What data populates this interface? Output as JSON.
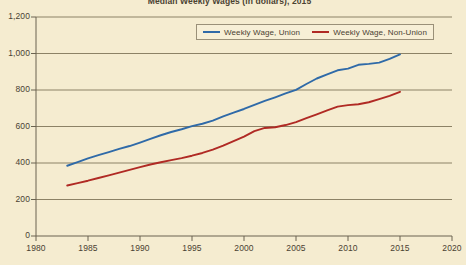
{
  "chart_data": {
    "type": "line",
    "title": "Median Weekly Wages (in dollars), 2015",
    "xlabel": "",
    "ylabel": "",
    "xlim": [
      1980,
      2020
    ],
    "ylim": [
      0,
      1200
    ],
    "grid": true,
    "legend_position": "top-right",
    "x_ticks": [
      "1980",
      "1985",
      "1990",
      "1995",
      "2000",
      "2005",
      "2010",
      "2015",
      "2020"
    ],
    "y_ticks": [
      "0",
      "200",
      "400",
      "600",
      "800",
      "1,000",
      "1,200"
    ],
    "series": [
      {
        "name": "Weekly Wage, Union",
        "color": "#2f6aa8",
        "x": [
          1983,
          1984,
          1985,
          1986,
          1987,
          1988,
          1989,
          1990,
          1991,
          1992,
          1993,
          1994,
          1995,
          1996,
          1997,
          1998,
          1999,
          2000,
          2001,
          2002,
          2003,
          2004,
          2005,
          2006,
          2007,
          2008,
          2009,
          2010,
          2011,
          2012,
          2013,
          2014,
          2015
        ],
        "values": [
          385,
          405,
          425,
          443,
          460,
          477,
          493,
          512,
          532,
          552,
          570,
          585,
          602,
          615,
          632,
          655,
          676,
          696,
          718,
          740,
          760,
          781,
          801,
          833,
          863,
          886,
          908,
          917,
          938,
          943,
          950,
          970,
          995
        ]
      },
      {
        "name": "Weekly Wage, Non-Union",
        "color": "#b02a24",
        "x": [
          1983,
          1984,
          1985,
          1986,
          1987,
          1988,
          1989,
          1990,
          1991,
          1992,
          1993,
          1994,
          1995,
          1996,
          1997,
          1998,
          1999,
          2000,
          2001,
          2002,
          2003,
          2004,
          2005,
          2006,
          2007,
          2008,
          2009,
          2010,
          2011,
          2012,
          2013,
          2014,
          2015
        ],
        "values": [
          277,
          290,
          303,
          318,
          332,
          347,
          362,
          377,
          392,
          404,
          416,
          427,
          440,
          455,
          473,
          495,
          520,
          545,
          575,
          592,
          596,
          608,
          624,
          646,
          667,
          688,
          709,
          717,
          722,
          733,
          750,
          768,
          790
        ]
      }
    ]
  },
  "legend": {
    "entries": [
      {
        "label": "Weekly Wage, Union"
      },
      {
        "label": "Weekly Wage, Non-Union"
      }
    ]
  }
}
